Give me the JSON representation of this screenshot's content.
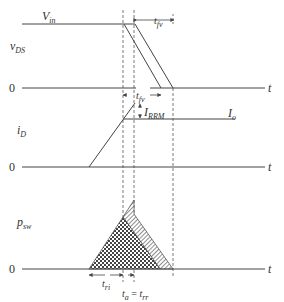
{
  "diagram": {
    "colors": {
      "line": "#444444",
      "dash": "#555555",
      "text": "#333333",
      "background": "#ffffff"
    },
    "panels": [
      {
        "id": "vds",
        "label_main": "v",
        "label_sub": "DS",
        "zero_label": "0",
        "axis_label": "t",
        "level_label_main": "V",
        "level_label_sub": "in",
        "interval_label_main": "t",
        "interval_label_sub": "fv"
      },
      {
        "id": "id",
        "label_main": "i",
        "label_sub": "D",
        "zero_label": "0",
        "axis_label": "t",
        "peak_label_main": "I",
        "peak_label_sub": "RRM",
        "level_label_main": "I",
        "level_label_sub": "o"
      },
      {
        "id": "psw",
        "label_main": "p",
        "label_sub": "sw",
        "zero_label": "0",
        "axis_label": "t",
        "interval_tri_main": "t",
        "interval_tri_sub": "ri",
        "interval_ta_main": "t",
        "interval_ta_sub": "a",
        "equals": " = ",
        "interval_trr_main": "t",
        "interval_trr_sub": "rr"
      }
    ]
  }
}
